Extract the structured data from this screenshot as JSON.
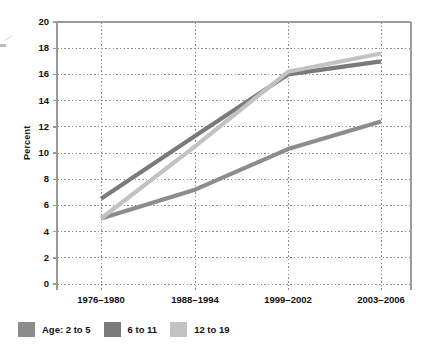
{
  "chart_data": {
    "type": "line",
    "title": "",
    "xlabel": "",
    "ylabel": "Percent",
    "categories": [
      "1976–1980",
      "1988–1994",
      "1999–2002",
      "2003–2006"
    ],
    "ylim": [
      0,
      20
    ],
    "yticks": [
      "0",
      "2",
      "4",
      "6",
      "8",
      "10",
      "12",
      "14",
      "16",
      "18",
      "20"
    ],
    "grid": "dotted-both",
    "legend_position": "bottom-left",
    "legend_prefix": "Age:",
    "series": [
      {
        "name": "2 to 5",
        "color": "#8c8c8c",
        "values": [
          5.0,
          7.2,
          10.3,
          12.4
        ]
      },
      {
        "name": "6 to 11",
        "color": "#7a7a7a",
        "values": [
          6.5,
          11.3,
          16.0,
          17.0
        ]
      },
      {
        "name": "12 to 19",
        "color": "#c2c2c2",
        "values": [
          5.0,
          10.5,
          16.2,
          17.6
        ]
      }
    ]
  },
  "axis": {
    "y_label": "Percent"
  },
  "legend": {
    "prefix": "Age:",
    "items": [
      {
        "label": "2 to 5",
        "color": "#8c8c8c"
      },
      {
        "label": "6 to 11",
        "color": "#7a7a7a"
      },
      {
        "label": "12 to 19",
        "color": "#c2c2c2"
      }
    ]
  },
  "colors": {
    "frame": "#9a9a9a",
    "grid": "#8d8d8d",
    "text": "#111111",
    "background": "#ffffff"
  }
}
